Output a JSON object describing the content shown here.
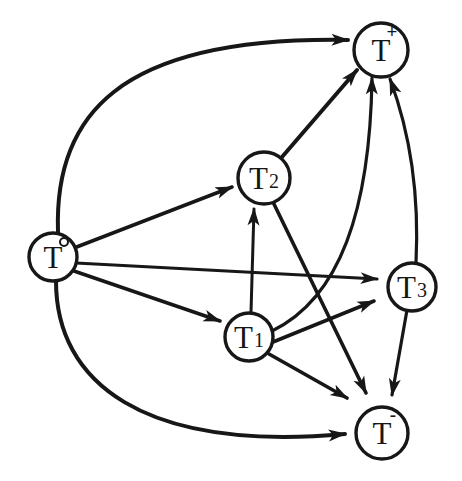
{
  "diagram": {
    "background": "#ffffff",
    "ink": "#171717",
    "node_fill": "#ffffff",
    "nodes": [
      {
        "id": "T0",
        "base": "T",
        "sup": "ring",
        "sup_glyph": "°",
        "x": 53,
        "y": 257,
        "r": 24
      },
      {
        "id": "Tplus",
        "base": "T",
        "sup": "text",
        "sup_glyph": "+",
        "x": 381,
        "y": 50,
        "r": 27
      },
      {
        "id": "T2",
        "base": "T",
        "sub": "2",
        "x": 264,
        "y": 178,
        "r": 26
      },
      {
        "id": "T3",
        "base": "T",
        "sub": "3",
        "x": 412,
        "y": 287,
        "r": 24
      },
      {
        "id": "T1",
        "base": "T",
        "sub": "1",
        "x": 249,
        "y": 337,
        "r": 24
      },
      {
        "id": "Tminus",
        "base": "T",
        "sup": "text",
        "sup_glyph": "-",
        "x": 382,
        "y": 433,
        "r": 26
      }
    ],
    "edges": [
      {
        "from": "T0",
        "to": "Tplus",
        "path": "M 58 232 C 54 118 115 36 348 40",
        "width": 4
      },
      {
        "from": "T0",
        "to": "T2",
        "path": "M 74 248 L 232 187",
        "width": 3.6
      },
      {
        "from": "T0",
        "to": "T3",
        "path": "M 76 263 L 377 279",
        "width": 3.2
      },
      {
        "from": "T0",
        "to": "T1",
        "path": "M 71 270 L 220 321",
        "width": 3.6
      },
      {
        "from": "T0",
        "to": "Tminus",
        "path": "M 56 281 C 56 382 142 452 345 434",
        "width": 4
      },
      {
        "from": "T1",
        "to": "T2",
        "path": "M 251 312 L 254 209",
        "width": 3
      },
      {
        "from": "T2",
        "to": "Tplus",
        "path": "M 282 157 L 357 70",
        "width": 4
      },
      {
        "from": "T2",
        "to": "Tminus",
        "path": "M 273 202 L 366 393",
        "width": 3.6
      },
      {
        "from": "T1",
        "to": "T3",
        "path": "M 273 342 L 374 301",
        "width": 3.6
      },
      {
        "from": "T1",
        "to": "Tminus",
        "path": "M 269 354 L 347 398",
        "width": 3.6
      },
      {
        "from": "T1",
        "to": "Tplus",
        "path": "M 272 331 C 340 298 370 210 372 78",
        "width": 3.2
      },
      {
        "from": "T3",
        "to": "Tplus",
        "path": "M 416 263 Q 421 162 390 79",
        "width": 3.2
      },
      {
        "from": "T3",
        "to": "Tminus",
        "path": "M 407 310 L 392 395",
        "width": 3.2
      }
    ]
  }
}
